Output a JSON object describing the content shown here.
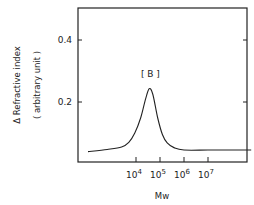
{
  "chart_data": {
    "type": "line",
    "title": "",
    "xlabel": "Mw",
    "ylabel": "Δ Refractive index",
    "ylabel_sub": "( arbitrary unit )",
    "x_scale": "log10",
    "xlim_log10": [
      1.8,
      9.0
    ],
    "ylim": [
      0.0,
      0.5
    ],
    "x_ticks": [
      {
        "log10": 4,
        "base": "10",
        "exp": "4"
      },
      {
        "log10": 5,
        "base": "10",
        "exp": "5"
      },
      {
        "log10": 6,
        "base": "10",
        "exp": "6"
      },
      {
        "log10": 7,
        "base": "10",
        "exp": "7"
      }
    ],
    "y_ticks": [
      {
        "value": 0.2,
        "label": "0.2"
      },
      {
        "value": 0.4,
        "label": "0.4"
      }
    ],
    "grid": false,
    "annotations": [
      {
        "text": "[ B ]",
        "x_log10": 4.6,
        "y": 0.29
      }
    ],
    "series": [
      {
        "name": "B",
        "points": [
          [
            2.0,
            0.04
          ],
          [
            2.8,
            0.047
          ],
          [
            3.4,
            0.055
          ],
          [
            3.7,
            0.07
          ],
          [
            3.95,
            0.1
          ],
          [
            4.2,
            0.15
          ],
          [
            4.4,
            0.21
          ],
          [
            4.55,
            0.243
          ],
          [
            4.7,
            0.225
          ],
          [
            4.9,
            0.15
          ],
          [
            5.1,
            0.095
          ],
          [
            5.3,
            0.068
          ],
          [
            5.6,
            0.052
          ],
          [
            6.0,
            0.045
          ],
          [
            7.0,
            0.045
          ],
          [
            8.0,
            0.045
          ],
          [
            8.8,
            0.045
          ]
        ]
      }
    ]
  }
}
